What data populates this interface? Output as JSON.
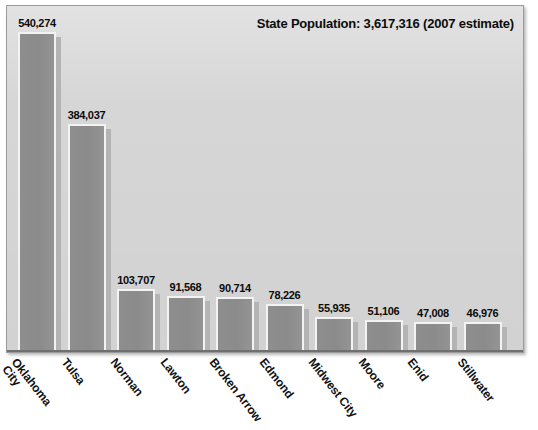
{
  "chart_data": {
    "type": "bar",
    "title": "State Population: 3,617,316 (2007 estimate)",
    "xlabel": "",
    "ylabel": "",
    "grid": false,
    "legend": "none",
    "ylim": [
      0,
      540274
    ],
    "categories": [
      "Oklahoma City",
      "Tulsa",
      "Norman",
      "Lawton",
      "Broken Arrow",
      "Edmond",
      "Midwest City",
      "Moore",
      "Enid",
      "Stillwater"
    ],
    "values": [
      540274,
      384037,
      103707,
      91568,
      90714,
      78226,
      55935,
      51106,
      47008,
      46976
    ],
    "value_labels": [
      "540,274",
      "384,037",
      "103,707",
      "91,568",
      "90,714",
      "78,226",
      "55,935",
      "51,106",
      "47,008",
      "46,976"
    ],
    "category_label_lines": [
      "Oklahoma\nCity",
      "Tulsa",
      "Norman",
      "Lawton",
      "Broken Arrow",
      "Edmond",
      "Midwest City",
      "Moore",
      "Enid",
      "Stillwater"
    ]
  },
  "colors": {
    "plot_background": "#d6d6d6",
    "bar_fill": "#8b8b8b",
    "bar_border": "#f3f3f3",
    "bar_shadow": "#b4b4b4",
    "axis": "#6f6f6f",
    "text": "#0b0b0b",
    "page_background": "#ffffff"
  }
}
